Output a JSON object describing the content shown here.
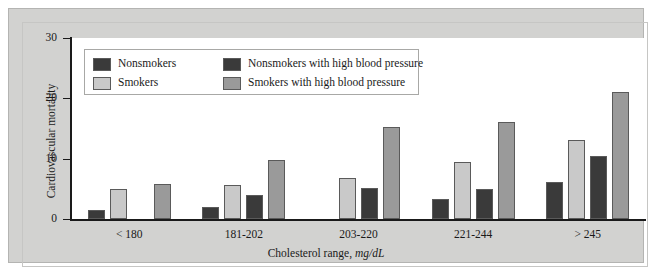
{
  "chart_data": {
    "type": "bar",
    "title": "",
    "subtitle": "",
    "xlabel": "Cholesterol range, mg/dL",
    "xlabel_plain": "Cholesterol range, ",
    "xlabel_italic": "mg/dL",
    "ylabel": "Cardiovascular mortality",
    "ylim": [
      0,
      30
    ],
    "yticks": [
      0,
      10,
      20,
      30
    ],
    "ytick_labels": [
      "0",
      "10",
      "20",
      "30"
    ],
    "grid": false,
    "legend_position": "inside-top-left",
    "categories": [
      "< 180",
      "181-202",
      "203-220",
      "221-244",
      "> 245"
    ],
    "series": [
      {
        "name": "Nonsmokers",
        "color": "#3a3a3a",
        "values": [
          1.5,
          2.0,
          0,
          3.4,
          6.1
        ]
      },
      {
        "name": "Smokers",
        "color": "#c9c9c9",
        "values": [
          5.0,
          5.6,
          6.8,
          9.5,
          13.1
        ]
      },
      {
        "name": "Nonsmokers with high blood pressure",
        "color": "#3a3a3a",
        "values": [
          0,
          4.0,
          5.2,
          5.0,
          10.4
        ]
      },
      {
        "name": "Smokers with high blood pressure",
        "color": "#9a9a9a",
        "values": [
          5.8,
          9.8,
          15.3,
          16.0,
          21.1
        ]
      }
    ]
  },
  "legend": {
    "entries": [
      {
        "label": "Nonsmokers",
        "color": "#3a3a3a"
      },
      {
        "label": "Smokers",
        "color": "#c9c9c9"
      },
      {
        "label": "Nonsmokers with high blood pressure",
        "color": "#3a3a3a"
      },
      {
        "label": "Smokers with high blood pressure",
        "color": "#9a9a9a"
      }
    ]
  },
  "colors": {
    "panel_background": "#d2d2d0",
    "plot_background": "#ffffff",
    "axis": "#1a1a1a",
    "bar_outline": "#5a5a5a"
  }
}
